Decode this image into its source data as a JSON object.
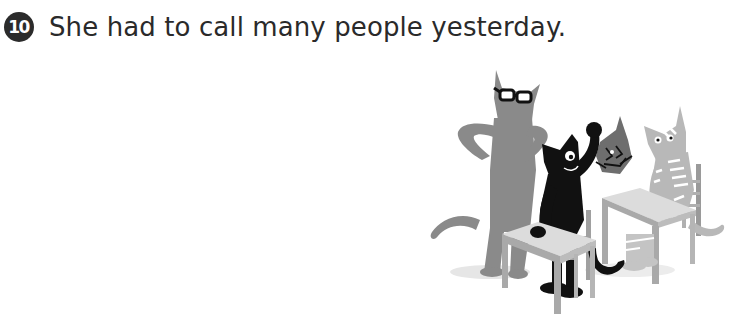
{
  "exercise": {
    "number": "10",
    "sentence": "She had to call many people yesterday."
  },
  "illustration": {
    "description": "Classroom scene with four cats: a tall gray cat wearing glasses standing with hands on hips, a black cat raising a fist while leaning on a desk, a small dark-gray cat face with scribbled expression, and a light-gray striped cat standing on a desk beside a chair",
    "colors": {
      "tall_cat": "#8a8a8a",
      "black_cat": "#111111",
      "small_cat": "#6e6e6e",
      "striped_cat": "#b8b8b8",
      "desk_top": "#dcdcdc",
      "desk_side": "#a9a9a9",
      "chair": "#9a9a9a"
    }
  }
}
